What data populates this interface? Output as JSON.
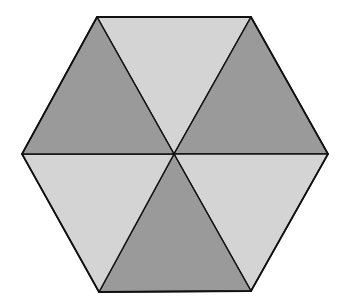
{
  "figure": {
    "shape": "regular hexagon",
    "triangles": [
      {
        "position": "top",
        "shade": "light"
      },
      {
        "position": "upper-right",
        "shade": "dark"
      },
      {
        "position": "lower-right",
        "shade": "light"
      },
      {
        "position": "bottom",
        "shade": "dark"
      },
      {
        "position": "lower-left",
        "shade": "light"
      },
      {
        "position": "upper-left",
        "shade": "dark"
      }
    ],
    "colors": {
      "dark": "#9a9a9a",
      "light": "#d4d4d4",
      "stroke": "#111111",
      "background": "#ffffff"
    }
  }
}
